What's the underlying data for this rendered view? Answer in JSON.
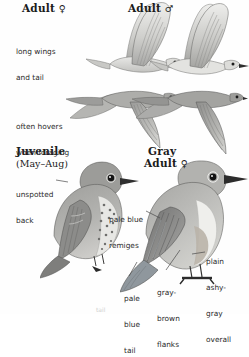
{
  "plate": {
    "subject": "Mountain Bluebird",
    "background_color": "#fefefe"
  },
  "headings": [
    {
      "id": "adult-female-flight",
      "text": "Adult ",
      "symbol": "♀"
    },
    {
      "id": "adult-male-flight",
      "text": "Adult ",
      "symbol": "♂"
    },
    {
      "id": "juvenile",
      "text": "Juvenile",
      "symbol": ""
    },
    {
      "id": "gray-adult-line1",
      "text": "Gray",
      "symbol": ""
    },
    {
      "id": "gray-adult-line2",
      "text": "Adult ",
      "symbol": "♀"
    }
  ],
  "subheadings": [
    {
      "id": "juvenile-months",
      "text": "(May–Aug)"
    }
  ],
  "annotations": [
    {
      "id": "long-wings-and-tail",
      "lines": [
        "long wings",
        "and tail"
      ]
    },
    {
      "id": "often-hovers",
      "lines": [
        "often hovers",
        "when foraging"
      ]
    },
    {
      "id": "unspotted-back",
      "lines": [
        "unspotted",
        "back"
      ]
    },
    {
      "id": "pale-blue-remiges",
      "lines": [
        "pale blue",
        "remiges"
      ]
    },
    {
      "id": "pale-blue-tail",
      "lines": [
        "pale",
        "blue",
        "tail"
      ]
    },
    {
      "id": "gray-brown-flanks",
      "lines": [
        "gray-",
        "brown",
        "flanks"
      ]
    },
    {
      "id": "plain-ashy-gray",
      "lines": [
        "plain",
        "ashy-",
        "gray",
        "overall"
      ]
    }
  ],
  "footer": {
    "cut_text": "tail"
  },
  "colors": {
    "ink": "#1b1b1b",
    "annotation_ink": "#2a2a2a",
    "leader_line": "#4a4a4a",
    "bird_gray_light": "#d9d9d6",
    "bird_gray_mid": "#b3b3b0",
    "bird_gray_dark": "#8a8a88",
    "bird_gray_darkest": "#5e5e5d",
    "bird_outline": "#3a3a3a",
    "bird_belly": "#f2f2f0"
  }
}
